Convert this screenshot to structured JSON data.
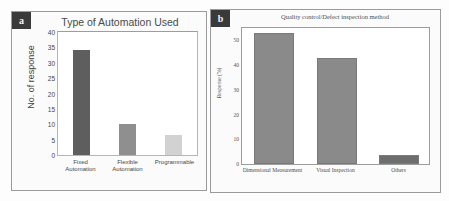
{
  "figure": {
    "panels": [
      {
        "tag": "a",
        "title": "Type of Automation Used",
        "ylabel": "No. of response",
        "accent_colors": [
          "#5e5e5e",
          "#8f8f8f",
          "#d2d2d2"
        ],
        "yticks": [
          "0",
          "5",
          "10",
          "15",
          "20",
          "25",
          "30",
          "35",
          "40"
        ]
      },
      {
        "tag": "b",
        "title": "Quality control/Defect inspection method",
        "ylabel": "Response (%)",
        "accent_colors": [
          "#8a8a8a",
          "#8a8a8a",
          "#6d6d6d"
        ],
        "yticks": [
          "0",
          "10",
          "20",
          "30",
          "40",
          "50"
        ]
      }
    ]
  },
  "chart_data": [
    {
      "type": "bar",
      "title": "Type of Automation Used",
      "xlabel": "",
      "ylabel": "No. of response",
      "categories": [
        "Fixed Automation",
        "Flexible Automation",
        "Programmable"
      ],
      "values": [
        34,
        10,
        6.5
      ],
      "ylim": [
        0,
        40
      ],
      "ytick_step": 5,
      "grid": false,
      "legend": "none",
      "bar_colors": [
        "#5e5e5e",
        "#8f8f8f",
        "#d2d2d2"
      ]
    },
    {
      "type": "bar",
      "title": "Quality control/Defect inspection method",
      "xlabel": "",
      "ylabel": "Response (%)",
      "categories": [
        "Dimensional Measurement",
        "Visual Inspection",
        "Others"
      ],
      "values": [
        52,
        42,
        3
      ],
      "ylim": [
        0,
        55
      ],
      "ytick_step": 10,
      "grid": false,
      "legend": "none",
      "bar_colors": [
        "#8a8a8a",
        "#8a8a8a",
        "#6d6d6d"
      ]
    }
  ]
}
